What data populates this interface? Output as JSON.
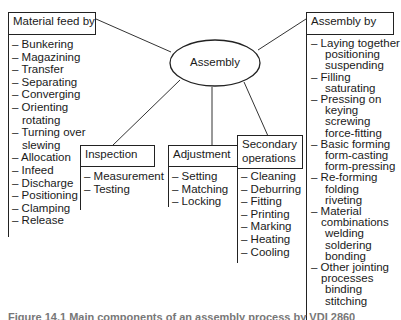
{
  "center": {
    "label": "Assembly"
  },
  "material_feed": {
    "title": "Material feed by",
    "items": [
      {
        "text": "– Bunkering",
        "level": 0
      },
      {
        "text": "– Magazining",
        "level": 0
      },
      {
        "text": "– Transfer",
        "level": 0
      },
      {
        "text": "– Separating",
        "level": 0
      },
      {
        "text": "– Converging",
        "level": 0
      },
      {
        "text": "– Orienting",
        "level": 0
      },
      {
        "text": "rotating",
        "level": 1
      },
      {
        "text": "– Turning over",
        "level": 0
      },
      {
        "text": "slewing",
        "level": 1
      },
      {
        "text": "– Allocation",
        "level": 0
      },
      {
        "text": "– Infeed",
        "level": 0
      },
      {
        "text": "– Discharge",
        "level": 0
      },
      {
        "text": "– Positioning",
        "level": 0
      },
      {
        "text": "– Clamping",
        "level": 0
      },
      {
        "text": "– Release",
        "level": 0
      }
    ]
  },
  "inspection": {
    "title": "Inspection",
    "items": [
      "– Measurement",
      "– Testing"
    ]
  },
  "adjustment": {
    "title": "Adjustment",
    "items": [
      "– Setting",
      "– Matching",
      "– Locking"
    ]
  },
  "secondary_operations": {
    "title_line1": "Secondary",
    "title_line2": "operations",
    "items": [
      "– Cleaning",
      "– Deburring",
      "– Fitting",
      "– Printing",
      "– Marking",
      "– Heating",
      "– Cooling"
    ]
  },
  "assembly_by": {
    "title": "Assembly by",
    "items": [
      {
        "text": "– Laying together",
        "level": 0
      },
      {
        "text": "positioning",
        "level": 2
      },
      {
        "text": "suspending",
        "level": 2
      },
      {
        "text": "– Filling",
        "level": 0
      },
      {
        "text": "saturating",
        "level": 2
      },
      {
        "text": "– Pressing on",
        "level": 0
      },
      {
        "text": "keying",
        "level": 2
      },
      {
        "text": "screwing",
        "level": 2
      },
      {
        "text": "force-fitting",
        "level": 2
      },
      {
        "text": "– Basic forming",
        "level": 0
      },
      {
        "text": "form-casting",
        "level": 2
      },
      {
        "text": "form-pressing",
        "level": 2
      },
      {
        "text": "– Re-forming",
        "level": 0
      },
      {
        "text": "folding",
        "level": 2
      },
      {
        "text": "riveting",
        "level": 2
      },
      {
        "text": "– Material",
        "level": 0
      },
      {
        "text": "combinations",
        "level": 1
      },
      {
        "text": "welding",
        "level": 2
      },
      {
        "text": "soldering",
        "level": 2
      },
      {
        "text": "bonding",
        "level": 2
      },
      {
        "text": "– Other jointing",
        "level": 0
      },
      {
        "text": "processes",
        "level": 1
      },
      {
        "text": "binding",
        "level": 2
      },
      {
        "text": "stitching",
        "level": 2
      }
    ]
  },
  "caption": "Figure 14.1 Main components of an assembly process by VDI 2860"
}
